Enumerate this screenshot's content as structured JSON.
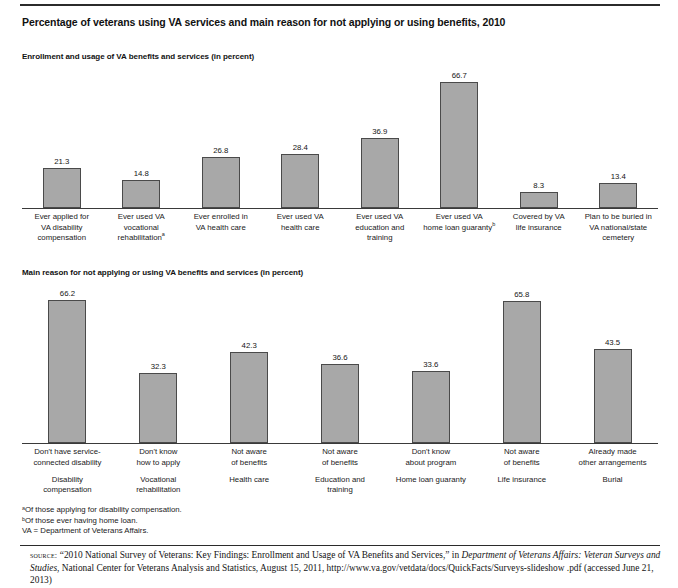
{
  "title": "Percentage of veterans using VA services and main reason for not applying or using benefits, 2010",
  "sections": {
    "one_head": "Enrollment and usage of VA benefits and services (in percent)",
    "two_head": "Main reason for not applying or using VA benefits and services (in percent)"
  },
  "footnotes": {
    "a": "ᵃOf those applying for disability compensation.",
    "b": "ᵇOf those ever having home loan.",
    "va": "VA = Department of Veterans Affairs."
  },
  "source": {
    "label": "source:",
    "part1": " “2010 National Survey of Veterans: Key Findings: Enrollment and Usage of VA Benefits and Services,” in ",
    "italic1": "Department of Veterans Affairs: Veteran Surveys and Studies",
    "part2": ", National Center for Veterans Analysis and Statistics, August 15, 2011, http://www.va.gov/vetdata/docs/QuickFacts/Surveys-slideshow .pdf (accessed June 21, 2013)"
  },
  "chart_data": [
    {
      "type": "bar",
      "title": "Enrollment and usage of VA benefits and services (in percent)",
      "xlabel": "",
      "ylabel": "Percent",
      "ylim": [
        0,
        70
      ],
      "grid": false,
      "legend": "none",
      "categories": [
        "Ever applied for VA disability compensation",
        "Ever used VA vocational rehabilitationᵃ",
        "Ever enrolled in VA health care",
        "Ever used VA health care",
        "Ever used VA education and training",
        "Ever used VA home loan guarantyᵇ",
        "Covered by VA life insurance",
        "Plan to be buried in VA national/state cemetery"
      ],
      "category_lines": [
        [
          "Ever applied for",
          "VA disability",
          "compensation"
        ],
        [
          "Ever used VA",
          "vocational",
          "rehabilitation"
        ],
        [
          "Ever enrolled in",
          "VA health care"
        ],
        [
          "Ever used VA",
          "health care"
        ],
        [
          "Ever used VA",
          "education and",
          "training"
        ],
        [
          "Ever used VA",
          "home loan guaranty"
        ],
        [
          "Covered by VA",
          "life insurance"
        ],
        [
          "Plan to be buried in",
          "VA national/state",
          "cemetery"
        ]
      ],
      "footnote_marks": [
        "",
        "a",
        "",
        "",
        "",
        "b",
        "",
        ""
      ],
      "values": [
        21.3,
        14.8,
        26.8,
        28.4,
        36.9,
        66.7,
        8.3,
        13.4
      ],
      "value_labels": [
        "21.3",
        "14.8",
        "26.8",
        "28.4",
        "36.9",
        "66.7",
        "8.3",
        "13.4"
      ]
    },
    {
      "type": "bar",
      "title": "Main reason for not applying or using VA benefits and services (in percent)",
      "xlabel": "",
      "ylabel": "Percent",
      "ylim": [
        0,
        70
      ],
      "grid": false,
      "legend": "none",
      "categories": [
        "Don't have service-connected disability",
        "Don't know how to apply",
        "Not aware of benefits",
        "Not aware of benefits",
        "Don't know about program",
        "Not aware of benefits",
        "Already made other arrangements"
      ],
      "category_lines": [
        [
          "Don't have service-",
          "connected disability"
        ],
        [
          "Don't know",
          "how to apply"
        ],
        [
          "Not aware",
          "of benefits"
        ],
        [
          "Not aware",
          "of benefits"
        ],
        [
          "Don't know",
          "about program"
        ],
        [
          "Not aware",
          "of benefits"
        ],
        [
          "Already made",
          "other arrangements"
        ]
      ],
      "subcategories": [
        [
          "Disability",
          "compensation"
        ],
        [
          "Vocational",
          "rehabilitation"
        ],
        [
          "Health care"
        ],
        [
          "Education and",
          "training"
        ],
        [
          "Home loan guaranty"
        ],
        [
          "Life insurance"
        ],
        [
          "Burial"
        ]
      ],
      "values": [
        66.2,
        32.3,
        42.3,
        36.6,
        33.6,
        65.8,
        43.5
      ],
      "value_labels": [
        "66.2",
        "32.3",
        "42.3",
        "36.6",
        "33.6",
        "65.8",
        "43.5"
      ]
    }
  ],
  "style": {
    "bar_fill": "#a8a8a8",
    "bar_border": "#4a4a4a",
    "rule": "#2b2b2b"
  }
}
